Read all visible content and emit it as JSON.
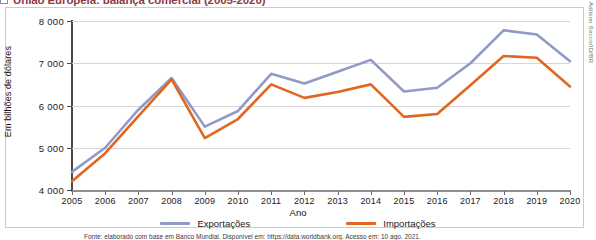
{
  "title": {
    "text": "União Europeia: balança comercial (2005-2020)",
    "marker": "legend-square-marker"
  },
  "credit": "Adilson Secco/ID/BR",
  "caption": "Fonte: elaborado com base em Banco Mundial. Disponível em: https://data.worldbank.org. Acesso em: 10 ago. 2021.",
  "axes": {
    "y_title": "Em bilhões de dólares",
    "x_title": "Ano",
    "y_ticks": [
      "4000",
      "5000",
      "6000",
      "7000",
      "8000"
    ],
    "x_ticks": [
      "2005",
      "2006",
      "2007",
      "2008",
      "2009",
      "2010",
      "2011",
      "2012",
      "2013",
      "2014",
      "2015",
      "2016",
      "2017",
      "2018",
      "2019",
      "2020"
    ]
  },
  "legend": {
    "position": "bottom",
    "items": [
      {
        "label": "Exportações",
        "color": "#8f9bc6"
      },
      {
        "label": "Importações",
        "color": "#e1661f"
      }
    ]
  },
  "colors": {
    "exportacoes": "#8f9bc6",
    "importacoes": "#e1661f",
    "grid": "#d6d6d6",
    "axis": "#4a4a4a",
    "frame": "#cfc9cf",
    "title": "#8d3a4a"
  },
  "chart_data": {
    "type": "line",
    "title": "União Europeia: balança comercial (2005-2020)",
    "xlabel": "Ano",
    "ylabel": "Em bilhões de dólares",
    "grid": true,
    "legend_position": "bottom",
    "ylim": [
      4000,
      8000
    ],
    "x": [
      2005,
      2006,
      2007,
      2008,
      2009,
      2010,
      2011,
      2012,
      2013,
      2014,
      2015,
      2016,
      2017,
      2018,
      2019,
      2020
    ],
    "categories": [
      "2005",
      "2006",
      "2007",
      "2008",
      "2009",
      "2010",
      "2011",
      "2012",
      "2013",
      "2014",
      "2015",
      "2016",
      "2017",
      "2018",
      "2019",
      "2020"
    ],
    "series": [
      {
        "name": "Exportações",
        "color": "#8f9bc6",
        "values": [
          4430,
          5000,
          5900,
          6650,
          5500,
          5870,
          6750,
          6520,
          6800,
          7080,
          6330,
          6420,
          7000,
          7780,
          7680,
          7050
        ]
      },
      {
        "name": "Importações",
        "color": "#e1661f",
        "values": [
          4210,
          4870,
          5750,
          6620,
          5230,
          5680,
          6500,
          6180,
          6320,
          6500,
          5730,
          5800,
          6480,
          7170,
          7130,
          6450
        ]
      }
    ]
  }
}
